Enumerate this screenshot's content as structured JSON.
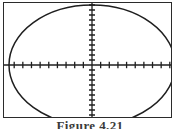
{
  "figure": {
    "caption": "Figure 4.21",
    "frame": {
      "x": 3,
      "y": 2,
      "width": 169,
      "height": 116,
      "border_color": "#2b2b2b"
    }
  },
  "chart_data": {
    "type": "line",
    "title": "Figure 4.21",
    "subtitle": "",
    "xlabel": "",
    "ylabel": "",
    "curve_name": "ellipse",
    "curve_color": "#1f1f1f",
    "axis_color": "#1f1f1f",
    "grid": false,
    "legend": "none",
    "xlim": [
      -10,
      10
    ],
    "ylim": [
      -6.2,
      6.2
    ],
    "origin_pixel": [
      91,
      64
    ],
    "ellipse": {
      "center_x": 0,
      "center_y": 0,
      "semi_axis_x": 9.6,
      "semi_axis_y": 6.0,
      "equation": "x^2/9.6^2 + y^2/6.0^2 = 1"
    },
    "x_axis": {
      "tick_spacing": 1,
      "tick_values": [
        -9,
        -8,
        -7,
        -6,
        -5,
        -4,
        -3,
        -2,
        -1,
        1,
        2,
        3,
        4,
        5,
        6,
        7,
        8,
        9
      ],
      "tick_count": 18,
      "tick_labels_shown": false,
      "axis_pixel_y": 64
    },
    "y_axis": {
      "tick_spacing": 0.5,
      "tick_values": [
        -6.0,
        -5.5,
        -5.0,
        -4.5,
        -4.0,
        -3.5,
        -3.0,
        -2.5,
        -2.0,
        -1.5,
        -1.0,
        -0.5,
        0.5,
        1.0,
        1.5,
        2.0,
        2.5,
        3.0,
        3.5,
        4.0,
        4.5,
        5.0,
        5.5,
        6.0
      ],
      "tick_count": 24,
      "tick_labels_shown": false,
      "axis_pixel_x": 91
    }
  }
}
